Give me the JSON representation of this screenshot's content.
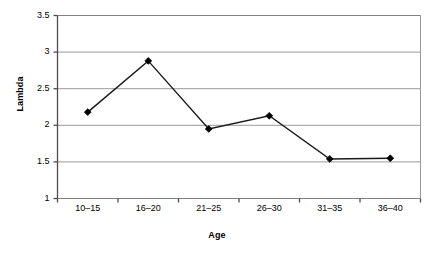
{
  "chart_data": {
    "type": "line",
    "title": "",
    "xlabel": "Age",
    "ylabel": "Lambda",
    "categories": [
      "10–15",
      "16–20",
      "21–25",
      "26–30",
      "31–35",
      "36–40"
    ],
    "values": [
      2.18,
      2.88,
      1.95,
      2.13,
      1.54,
      1.55
    ],
    "series": [
      {
        "name": "Lambda",
        "values": [
          2.18,
          2.88,
          1.95,
          2.13,
          1.54,
          1.55
        ]
      }
    ],
    "ylim": [
      1,
      3.5
    ],
    "yticks": [
      "1",
      "1.5",
      "2",
      "2.5",
      "3",
      "3.5"
    ],
    "ytick_values": [
      1,
      1.5,
      2,
      2.5,
      3,
      3.5
    ],
    "grid": "horizontal",
    "legend": "none",
    "marker": "diamond",
    "line_color": "#1a1a1a",
    "marker_color": "#000000",
    "grid_color": "#999999",
    "axis_color": "#808080",
    "plot_background": "#ffffff"
  }
}
